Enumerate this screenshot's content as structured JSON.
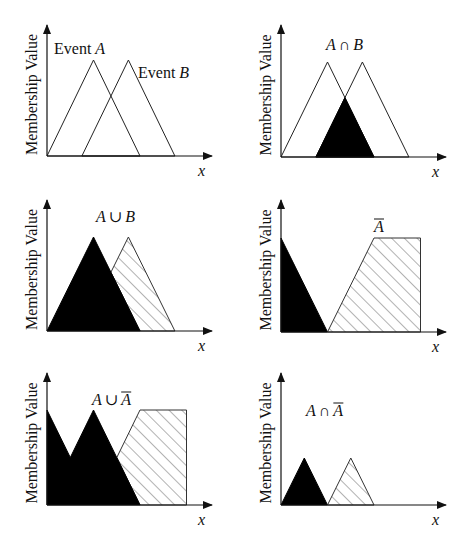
{
  "figure": {
    "y_axis_label": "Membership Value",
    "x_axis_label": "x",
    "colors": {
      "ink": "#111111",
      "fill_black": "#000000",
      "hatch": "#555555",
      "background": "#ffffff"
    }
  },
  "panels": [
    {
      "id": "events",
      "labels": [
        {
          "prefix": "Event ",
          "symbol": "A"
        },
        {
          "prefix": "Event ",
          "symbol": "B"
        }
      ],
      "shapes": [
        {
          "name": "event-a",
          "style": "outline",
          "points": [
            [
              0,
              0
            ],
            [
              0.5,
              1
            ],
            [
              1,
              0
            ]
          ]
        },
        {
          "name": "event-b",
          "style": "outline",
          "points": [
            [
              0.375,
              0
            ],
            [
              0.875,
              1
            ],
            [
              1.375,
              0
            ]
          ]
        }
      ]
    },
    {
      "id": "intersection",
      "title": {
        "left": "A",
        "op": "∩",
        "right": "B",
        "overline": false
      },
      "shapes": [
        {
          "name": "event-a",
          "style": "outline",
          "points": [
            [
              0,
              0
            ],
            [
              0.5,
              1
            ],
            [
              1,
              0
            ]
          ]
        },
        {
          "name": "event-b",
          "style": "outline",
          "points": [
            [
              0.375,
              0
            ],
            [
              0.875,
              1
            ],
            [
              1.375,
              0
            ]
          ]
        },
        {
          "name": "a-and-b",
          "style": "black",
          "points": [
            [
              0.375,
              0
            ],
            [
              0.6875,
              0.625
            ],
            [
              1,
              0
            ]
          ]
        }
      ]
    },
    {
      "id": "union",
      "title": {
        "left": "A",
        "op": "∪",
        "right": "B",
        "overline": false
      },
      "shapes": [
        {
          "name": "b-part",
          "style": "hatch",
          "points": [
            [
              0.6875,
              0.625
            ],
            [
              0.875,
              1
            ],
            [
              1.375,
              0
            ],
            [
              1,
              0
            ]
          ]
        },
        {
          "name": "a-part",
          "style": "black",
          "points": [
            [
              0,
              0
            ],
            [
              0.5,
              1
            ],
            [
              1,
              0
            ]
          ]
        }
      ]
    },
    {
      "id": "complement",
      "title": {
        "left": "",
        "op": "",
        "right": "A",
        "overline": true
      },
      "shapes": [
        {
          "name": "complement-left",
          "style": "black",
          "points": [
            [
              0,
              0
            ],
            [
              0,
              1
            ],
            [
              0.5,
              0
            ]
          ]
        },
        {
          "name": "complement-right",
          "style": "hatch",
          "points": [
            [
              0.5,
              0
            ],
            [
              1,
              1
            ],
            [
              1.5,
              1
            ],
            [
              1.5,
              0
            ]
          ]
        }
      ]
    },
    {
      "id": "union-complement",
      "title": {
        "left": "A",
        "op": "∪",
        "right": "A",
        "overline": true
      },
      "shapes": [
        {
          "name": "hatched-region",
          "style": "hatch",
          "points": [
            [
              0.75,
              0.5
            ],
            [
              1,
              1
            ],
            [
              1.5,
              1
            ],
            [
              1.5,
              0
            ],
            [
              1,
              0
            ]
          ]
        },
        {
          "name": "black-region",
          "style": "black",
          "points": [
            [
              0,
              0
            ],
            [
              0,
              1
            ],
            [
              0.25,
              0.5
            ],
            [
              0.5,
              1
            ],
            [
              1,
              0
            ]
          ]
        }
      ]
    },
    {
      "id": "intersection-complement",
      "title": {
        "left": "A",
        "op": "∩",
        "right": "A",
        "overline": true
      },
      "shapes": [
        {
          "name": "left-peak",
          "style": "black",
          "points": [
            [
              0,
              0
            ],
            [
              0.25,
              0.5
            ],
            [
              0.5,
              0
            ]
          ]
        },
        {
          "name": "right-peak",
          "style": "hatch",
          "points": [
            [
              0.5,
              0
            ],
            [
              0.75,
              0.5
            ],
            [
              1,
              0
            ]
          ]
        }
      ]
    }
  ]
}
